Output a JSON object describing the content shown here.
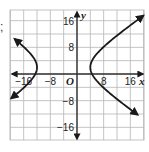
{
  "prefix_char": ";",
  "chart_data": {
    "type": "line",
    "title": "",
    "xlabel": "x",
    "ylabel": "y",
    "origin_label": "O",
    "xlim": [
      -20,
      20
    ],
    "ylim": [
      -20,
      19.5
    ],
    "grid": true,
    "grid_step": 4,
    "x_ticks": [
      {
        "value": -16,
        "label": "−16"
      },
      {
        "value": -8,
        "label": "−8"
      },
      {
        "value": 8,
        "label": "8"
      },
      {
        "value": 16,
        "label": "16"
      }
    ],
    "y_ticks": [
      {
        "value": 16,
        "label": "16"
      },
      {
        "value": 8,
        "label": "8"
      },
      {
        "value": -8,
        "label": "−8"
      },
      {
        "value": -16,
        "label": "−16"
      }
    ],
    "series": [
      {
        "name": "hyperbola",
        "kind": "horizontal hyperbola",
        "center": [
          -4,
          2
        ],
        "a": 8,
        "b": 5.5,
        "vertices": [
          [
            -12,
            2
          ],
          [
            4,
            2
          ]
        ],
        "branches": [
          {
            "name": "left-branch",
            "points": [
              [
                -19.5,
                12
              ],
              [
                -16,
                7.5
              ],
              [
                -13,
                4.5
              ],
              [
                -12,
                2
              ],
              [
                -13,
                -0.5
              ],
              [
                -16,
                -3.5
              ],
              [
                -19.5,
                -8
              ]
            ]
          },
          {
            "name": "right-branch",
            "points": [
              [
                19.5,
                17
              ],
              [
                12,
                11
              ],
              [
                6,
                6.5
              ],
              [
                4,
                2
              ],
              [
                6,
                -2.5
              ],
              [
                12,
                -7
              ],
              [
                19.5,
                -13
              ]
            ]
          }
        ],
        "color": "#1a1a1a",
        "arrows_at_ends": true
      }
    ]
  }
}
